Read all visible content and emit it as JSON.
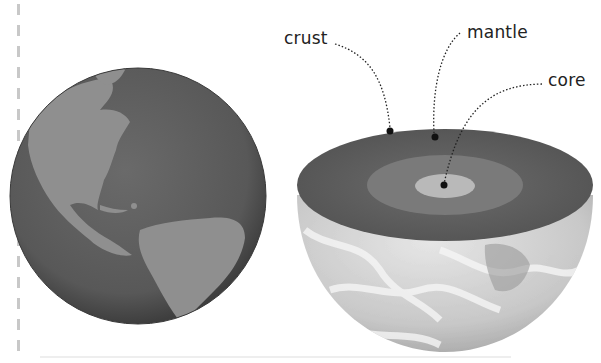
{
  "diagram": {
    "globe": {
      "name": "Earth globe",
      "ocean_color": "#5a5a5a",
      "land_color": "#8f8f8f"
    },
    "cutaway": {
      "name": "Earth cross-section half-sphere",
      "crust_color": "#5e5e5e",
      "mantle_color": "#7a7a7a",
      "core_color": "#b9b9b9"
    },
    "labels": [
      {
        "id": "crust",
        "text": "crust"
      },
      {
        "id": "mantle",
        "text": "mantle"
      },
      {
        "id": "core",
        "text": "core"
      }
    ]
  }
}
